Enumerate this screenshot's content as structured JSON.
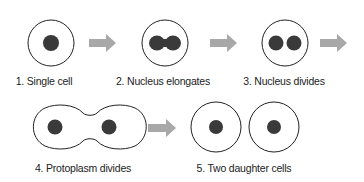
{
  "colors": {
    "outline": "#222222",
    "nucleus": "#3a3a3a",
    "arrow": "#a8a8a8",
    "text": "#222222"
  },
  "steps": [
    {
      "number": 1,
      "label": "1. Single cell"
    },
    {
      "number": 2,
      "label": "2. Nucleus elongates"
    },
    {
      "number": 3,
      "label": "3. Nucleus divides"
    },
    {
      "number": 4,
      "label": "4. Protoplasm divides"
    },
    {
      "number": 5,
      "label": "5. Two daughter cells"
    }
  ],
  "arrows": [
    "arrow-1-to-2",
    "arrow-2-to-3",
    "arrow-3-to-4",
    "arrow-4-to-5"
  ]
}
